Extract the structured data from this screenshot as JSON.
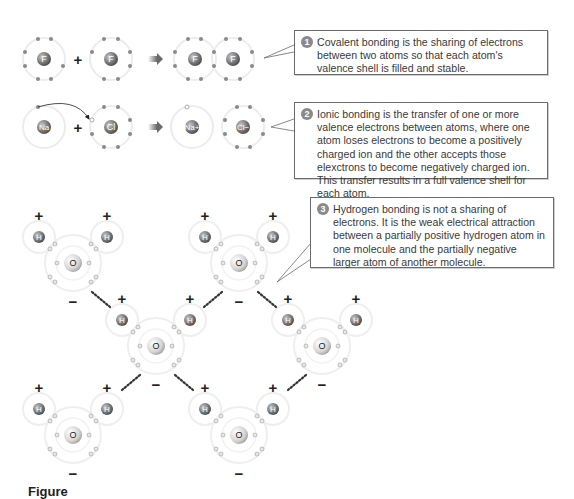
{
  "callouts": [
    {
      "number": "1",
      "text": "Covalent bonding is the sharing of electrons between two atoms so that each atom's valence shell is filled and stable."
    },
    {
      "number": "2",
      "text": "Ionic bonding is the transfer of one or more valence electrons between atoms, where one atom loses electrons to become a positively charged ion and the other accepts those elexctrons to become negatively charged ion. This transfer results in a full valence shell for each atom."
    },
    {
      "number": "3",
      "text": "Hydrogen bonding is not a sharing of electrons. It is the weak electrical attraction between a partially positive hydrogen atom in one molecule and the partially negative larger atom of another molecule."
    }
  ],
  "covalent_row": {
    "reactant_1": "F",
    "plus": "+",
    "reactant_2": "F",
    "product_1": "F",
    "product_2": "F"
  },
  "ionic_row": {
    "reactant_1": "Na",
    "plus": "+",
    "reactant_2": "Cl",
    "product_1": "Na+",
    "product_2": "Cl−"
  },
  "water": {
    "oxygen_label": "O",
    "hydrogen_label": "H",
    "partial_positive": "+",
    "partial_negative": "−"
  },
  "caption": "Figure"
}
